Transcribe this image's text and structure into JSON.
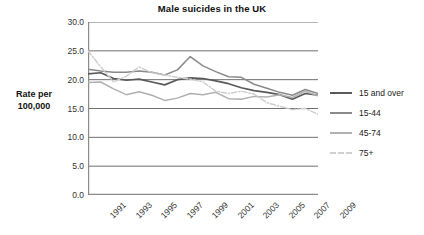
{
  "chart_data": {
    "type": "line",
    "title": "Male suicides in the UK",
    "xlabel": "",
    "ylabel": "Rate per\n100,000",
    "ylim": [
      0.0,
      30.0
    ],
    "ytick_step": 5.0,
    "ytick_labels": [
      "30.0",
      "25.0",
      "20.0",
      "15.0",
      "10.0",
      "5.0",
      "0.0"
    ],
    "ytick_values": [
      30.0,
      25.0,
      20.0,
      15.0,
      10.0,
      5.0,
      0.0
    ],
    "grid": "horizontal",
    "legend_position": "right",
    "x": [
      1991,
      1992,
      1993,
      1994,
      1995,
      1996,
      1997,
      1998,
      1999,
      2000,
      2001,
      2002,
      2003,
      2004,
      2005,
      2006,
      2007,
      2008,
      2009
    ],
    "xtick_labels": [
      "1991",
      "1993",
      "1995",
      "1997",
      "1999",
      "2001",
      "2003",
      "2005",
      "2007",
      "2009"
    ],
    "xtick_values": [
      1991,
      1993,
      1995,
      1997,
      1999,
      2001,
      2003,
      2005,
      2007,
      2009
    ],
    "series": [
      {
        "name": "15 and over",
        "color": "#595959",
        "style": "solid",
        "values": [
          21.0,
          21.2,
          20.2,
          19.9,
          20.1,
          19.6,
          19.1,
          20.0,
          20.3,
          20.2,
          19.8,
          19.3,
          18.6,
          18.1,
          17.8,
          17.4,
          16.6,
          17.6,
          17.3
        ]
      },
      {
        "name": "15-44",
        "color": "#8a8a8a",
        "style": "solid",
        "values": [
          21.8,
          21.5,
          21.3,
          21.3,
          21.5,
          21.3,
          20.8,
          21.7,
          24.0,
          22.4,
          21.4,
          20.5,
          20.4,
          19.2,
          18.5,
          17.8,
          17.3,
          18.3,
          17.6
        ]
      },
      {
        "name": "45-74",
        "color": "#b0b0b0",
        "style": "solid",
        "values": [
          19.5,
          19.6,
          18.4,
          17.4,
          17.9,
          17.3,
          16.4,
          16.8,
          17.6,
          17.4,
          17.8,
          16.7,
          16.6,
          17.1,
          17.0,
          17.4,
          16.9,
          18.0,
          17.2
        ]
      },
      {
        "name": "75+",
        "color": "#cfcfcf",
        "style": "dashdot",
        "values": [
          25.0,
          22.2,
          19.6,
          20.6,
          22.2,
          21.2,
          20.8,
          20.4,
          20.1,
          19.6,
          18.0,
          17.6,
          18.0,
          17.5,
          16.0,
          15.4,
          14.8,
          15.0,
          14.0
        ]
      }
    ]
  }
}
